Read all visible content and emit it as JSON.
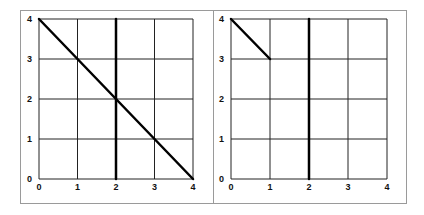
{
  "chart_data": [
    {
      "type": "line",
      "title": "",
      "xlabel": "",
      "ylabel": "",
      "xlim": [
        0,
        4
      ],
      "ylim": [
        0,
        4
      ],
      "grid": true,
      "x_ticks": [
        "0",
        "1",
        "2",
        "3",
        "4"
      ],
      "y_ticks": [
        "0",
        "1",
        "2",
        "3",
        "4"
      ],
      "series": [
        {
          "name": "diagonal",
          "x": [
            0,
            4
          ],
          "y": [
            4,
            0
          ]
        },
        {
          "name": "vertical",
          "x": [
            2,
            2
          ],
          "y": [
            0,
            4
          ]
        }
      ]
    },
    {
      "type": "line",
      "title": "",
      "xlabel": "",
      "ylabel": "",
      "xlim": [
        0,
        4
      ],
      "ylim": [
        0,
        4
      ],
      "grid": true,
      "x_ticks": [
        "0",
        "1",
        "2",
        "3",
        "4"
      ],
      "y_ticks": [
        "0",
        "1",
        "2",
        "3",
        "4"
      ],
      "series": [
        {
          "name": "diagonal-segment",
          "x": [
            0,
            1
          ],
          "y": [
            4,
            3
          ]
        },
        {
          "name": "vertical",
          "x": [
            2,
            2
          ],
          "y": [
            0,
            4
          ]
        }
      ]
    }
  ],
  "colors": {
    "line": "#000000",
    "grid": "#222222",
    "frame": "#9a9a9a"
  }
}
